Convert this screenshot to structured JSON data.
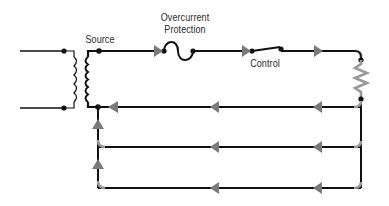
{
  "diagram": {
    "type": "electrical-circuit",
    "labels": {
      "source": "Source",
      "overcurrent_line1": "Overcurrent",
      "overcurrent_line2": "Protection",
      "control": "Control"
    },
    "components": [
      {
        "id": "source",
        "kind": "transformer",
        "label": "Source"
      },
      {
        "id": "overcurrent",
        "kind": "fuse",
        "label": "Overcurrent Protection"
      },
      {
        "id": "control",
        "kind": "switch",
        "label": "Control"
      },
      {
        "id": "load",
        "kind": "resistor",
        "label": ""
      }
    ],
    "return_paths": 3,
    "current_flow": "clockwise: source → fuse → switch → load → return paths → source",
    "colors": {
      "wire": "#111111",
      "flow_arrow": "#7a7a7a",
      "highlight": "#9a9a9a",
      "background": "#ffffff"
    }
  }
}
